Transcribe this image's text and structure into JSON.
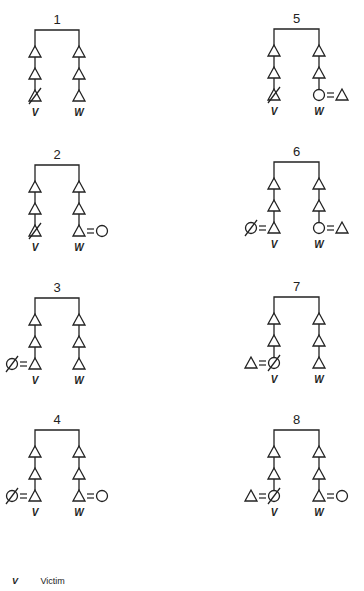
{
  "figure": {
    "panels": [
      {
        "id": "1",
        "left": {
          "end": "triangle-deceased",
          "marriage": null,
          "label": "V"
        },
        "right": {
          "end": "triangle",
          "marriage": null,
          "label": "W"
        }
      },
      {
        "id": "2",
        "left": {
          "end": "triangle-deceased",
          "marriage": null,
          "label": "V"
        },
        "right": {
          "end": "triangle",
          "marriage": "circle-right",
          "label": "W"
        }
      },
      {
        "id": "3",
        "left": {
          "end": "triangle",
          "marriage": "circle-deceased-left",
          "label": "V"
        },
        "right": {
          "end": "triangle",
          "marriage": null,
          "label": "W"
        }
      },
      {
        "id": "4",
        "left": {
          "end": "triangle",
          "marriage": "circle-deceased-left",
          "label": "V"
        },
        "right": {
          "end": "triangle",
          "marriage": "circle-right",
          "label": "W"
        }
      },
      {
        "id": "5",
        "left": {
          "end": "triangle-deceased",
          "marriage": null,
          "label": "V"
        },
        "right": {
          "end": "circle",
          "marriage": "triangle-right",
          "label": "W"
        }
      },
      {
        "id": "6",
        "left": {
          "end": "triangle",
          "marriage": "circle-deceased-left",
          "label": "V"
        },
        "right": {
          "end": "circle",
          "marriage": "triangle-right",
          "label": "W"
        }
      },
      {
        "id": "7",
        "left": {
          "end": "circle-deceased",
          "marriage": "triangle-left",
          "label": "V"
        },
        "right": {
          "end": "triangle",
          "marriage": null,
          "label": "W"
        }
      },
      {
        "id": "8",
        "left": {
          "end": "circle-deceased",
          "marriage": "triangle-left",
          "label": "V"
        },
        "right": {
          "end": "triangle",
          "marriage": "circle-right",
          "label": "W"
        }
      }
    ]
  },
  "legend": {
    "items": [
      {
        "symbol": "V",
        "label": "Victim"
      }
    ]
  },
  "colors": {
    "ink": "#222222",
    "background": "#ffffff"
  }
}
